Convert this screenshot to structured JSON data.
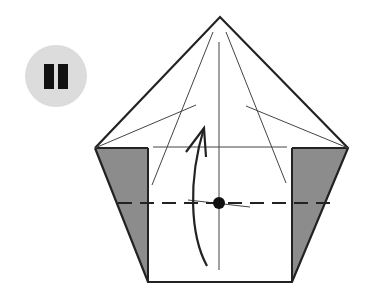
{
  "step": {
    "label": "II",
    "badge_color": "#dcdcdc",
    "numeral_color": "#111111"
  },
  "diagram": {
    "type": "origami-fold-instruction",
    "colors": {
      "outline": "#222222",
      "crease": "#444444",
      "flap_fill": "#8c8c8c",
      "paper": "#ffffff"
    },
    "elements": [
      "pentagon-outline",
      "left-gray-flap",
      "right-gray-flap",
      "center-vertical-crease",
      "horizontal-crease",
      "valley-fold-dashed-line",
      "pivot-dot",
      "fold-up-arrow"
    ]
  }
}
